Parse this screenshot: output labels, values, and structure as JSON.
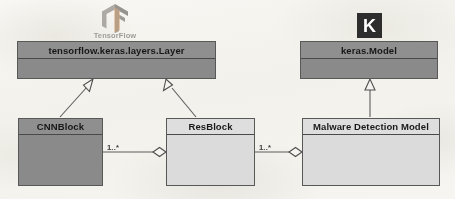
{
  "diagram": {
    "type": "uml-class-diagram",
    "background_color": "#f3f2ee",
    "classes": [
      {
        "id": "layer",
        "name": "tensorflow.keras.layers.Layer",
        "fill": "#8a8a8a",
        "shade": "dark",
        "x": 17,
        "y": 41,
        "w": 199,
        "h": 38,
        "title_h": 17,
        "font_size": 9.5
      },
      {
        "id": "keras-model",
        "name": "keras.Model",
        "fill": "#8a8a8a",
        "shade": "dark",
        "x": 300,
        "y": 41,
        "w": 138,
        "h": 38,
        "title_h": 17,
        "font_size": 9.5
      },
      {
        "id": "cnnblock",
        "name": "CNNBlock",
        "fill": "#8a8a8a",
        "shade": "dark",
        "x": 18,
        "y": 118,
        "w": 85,
        "h": 68,
        "title_h": 16,
        "font_size": 9.5
      },
      {
        "id": "resblock",
        "name": "ResBlock",
        "fill": "#d9d9d9",
        "shade": "light",
        "x": 166,
        "y": 118,
        "w": 89,
        "h": 68,
        "title_h": 16,
        "font_size": 9.5
      },
      {
        "id": "malware-detection-model",
        "name": "Malware Detection Model",
        "fill": "#d9d9d9",
        "shade": "light",
        "x": 302,
        "y": 118,
        "w": 138,
        "h": 68,
        "title_h": 16,
        "font_size": 9.5
      }
    ],
    "logos": [
      {
        "id": "tensorflow",
        "label": "TensorFlow",
        "accent_color": "#e8883a"
      },
      {
        "id": "keras",
        "label": "K",
        "background_color": "#2f2f2f",
        "text_color": "#ffffff"
      }
    ],
    "relationships": [
      {
        "id": "cnnblock-extends-layer",
        "kind": "generalization",
        "from": "CNNBlock",
        "to": "tensorflow.keras.layers.Layer",
        "arrow": "hollow-triangle",
        "multiplicity": ""
      },
      {
        "id": "resblock-extends-layer",
        "kind": "generalization",
        "from": "ResBlock",
        "to": "tensorflow.keras.layers.Layer",
        "arrow": "hollow-triangle",
        "multiplicity": ""
      },
      {
        "id": "malware-extends-keras-model",
        "kind": "generalization",
        "from": "Malware Detection Model",
        "to": "keras.Model",
        "arrow": "hollow-triangle",
        "multiplicity": ""
      },
      {
        "id": "cnnblock-aggregated-in-resblock",
        "kind": "aggregation",
        "from": "CNNBlock",
        "to": "ResBlock",
        "arrow": "hollow-diamond",
        "multiplicity": "1..*"
      },
      {
        "id": "resblock-aggregated-in-malware",
        "kind": "aggregation",
        "from": "ResBlock",
        "to": "Malware Detection Model",
        "arrow": "hollow-diamond",
        "multiplicity": "1..*"
      }
    ],
    "multiplicity_labels": [
      {
        "id": "mult-cnnblock-resblock",
        "text": "1..*",
        "x": 107,
        "y": 143
      },
      {
        "id": "mult-resblock-malware",
        "text": "1..*",
        "x": 259,
        "y": 143
      }
    ]
  }
}
